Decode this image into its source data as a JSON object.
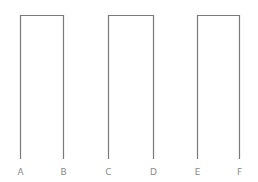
{
  "diagram": {
    "line_color": "#7a7a7a",
    "label_color": "#8a8a8a",
    "top_y": 15,
    "bottom_y": 159,
    "label_y": 175,
    "shapes": [
      {
        "left": {
          "x": 20,
          "label": "A"
        },
        "right": {
          "x": 63,
          "label": "B"
        }
      },
      {
        "left": {
          "x": 108,
          "label": "C"
        },
        "right": {
          "x": 153,
          "label": "D"
        }
      },
      {
        "left": {
          "x": 197,
          "label": "E"
        },
        "right": {
          "x": 239,
          "label": "F"
        }
      }
    ]
  }
}
